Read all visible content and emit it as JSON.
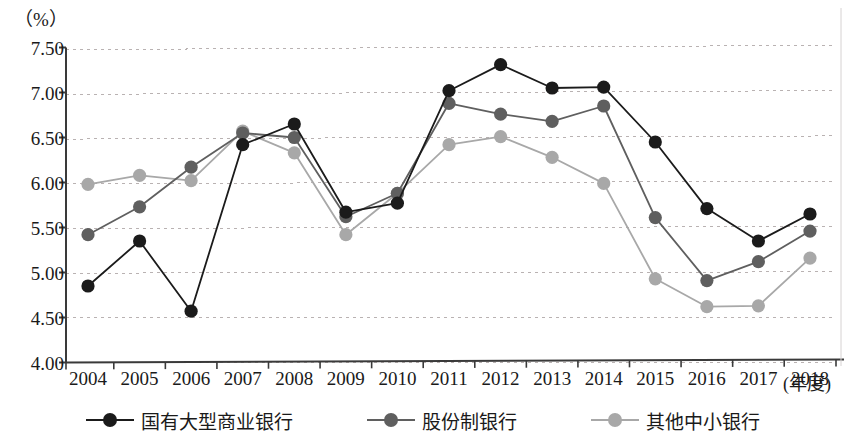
{
  "axis": {
    "unit_label": "（%）",
    "x_title": "(年度)",
    "y_ticks": [
      "7.50",
      "7.00",
      "6.50",
      "6.00",
      "5.50",
      "5.00",
      "4.50",
      "4.00"
    ]
  },
  "legend": {
    "items": [
      {
        "label": "国有大型商业银行",
        "color": "#1b1b1b",
        "name": "state-owned-large-commercial-banks"
      },
      {
        "label": "股份制银行",
        "color": "#5f5f5f",
        "name": "joint-stock-banks"
      },
      {
        "label": "其他中小银行",
        "color": "#a8a8a8",
        "name": "other-small-medium-banks"
      }
    ]
  },
  "chart_data": {
    "type": "line",
    "title": "",
    "xlabel": "(年度)",
    "ylabel": "（%）",
    "ylim": [
      4.0,
      7.5
    ],
    "ytick_step": 0.5,
    "grid": true,
    "legend_position": "bottom",
    "categories": [
      "2004",
      "2005",
      "2006",
      "2007",
      "2008",
      "2009",
      "2010",
      "2011",
      "2012",
      "2013",
      "2014",
      "2015",
      "2016",
      "2017",
      "2018"
    ],
    "series": [
      {
        "name": "国有大型商业银行",
        "color": "#1b1b1b",
        "values": [
          4.85,
          5.35,
          4.57,
          6.42,
          6.65,
          5.67,
          5.77,
          7.02,
          7.31,
          7.05,
          7.06,
          6.45,
          5.71,
          5.35,
          5.65
        ]
      },
      {
        "name": "股份制银行",
        "color": "#5f5f5f",
        "values": [
          5.42,
          5.73,
          6.17,
          6.55,
          6.5,
          5.62,
          5.88,
          6.88,
          6.76,
          6.68,
          6.85,
          5.61,
          4.91,
          5.12,
          5.46
        ]
      },
      {
        "name": "其他中小银行",
        "color": "#a8a8a8",
        "values": [
          5.98,
          6.08,
          6.02,
          6.57,
          6.33,
          5.42,
          5.88,
          6.42,
          6.51,
          6.28,
          5.99,
          4.93,
          4.62,
          4.63,
          5.16
        ]
      }
    ]
  }
}
